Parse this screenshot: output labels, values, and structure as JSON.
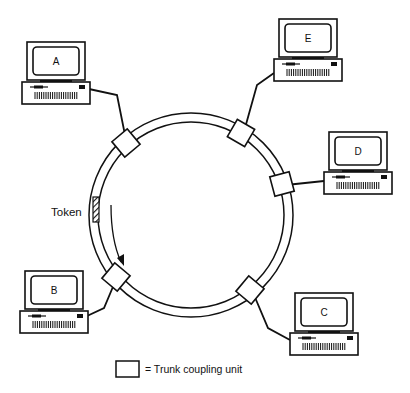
{
  "diagram": {
    "type": "token-ring-network",
    "ring": {
      "cx": 191,
      "cy": 215,
      "outer_r": 102,
      "inner_r": 93
    },
    "token": {
      "label": "Token",
      "direction": "counter-clockwise"
    },
    "stations": [
      {
        "id": "A",
        "label": "A",
        "x": 22,
        "y": 42,
        "unit_angle": 228
      },
      {
        "id": "E",
        "label": "E",
        "x": 274,
        "y": 19,
        "unit_angle": 308
      },
      {
        "id": "D",
        "label": "D",
        "x": 324,
        "y": 132,
        "unit_angle": 350
      },
      {
        "id": "B",
        "label": "B",
        "x": 20,
        "y": 272,
        "unit_angle": 145
      },
      {
        "id": "C",
        "label": "C",
        "x": 290,
        "y": 293,
        "unit_angle": 42
      }
    ],
    "legend": {
      "symbol": "square",
      "text": "= Trunk coupling unit"
    }
  },
  "colors": {
    "line": "#111111",
    "background": "#ffffff"
  }
}
